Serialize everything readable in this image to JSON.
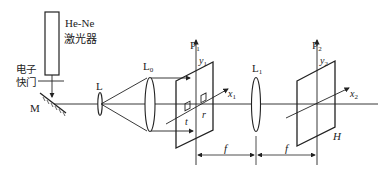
{
  "diagram": {
    "type": "optical-setup",
    "components": {
      "laser": {
        "label_line1": "He-Ne",
        "label_line2": "激光器"
      },
      "shutter": {
        "label_line1": "电子",
        "label_line2": "快门"
      },
      "mirror": {
        "label": "M"
      },
      "lens_expander": {
        "label": "L"
      },
      "lens_collimator": {
        "label": "L",
        "subscript": "0"
      },
      "plane_input": {
        "label": "P",
        "subscript": "1",
        "y_axis": "y",
        "y_sub": "1",
        "x_axis": "x",
        "x_sub": "1"
      },
      "apertures": {
        "t_label": "t",
        "r_label": "r"
      },
      "lens_fourier": {
        "label": "L",
        "subscript": "1"
      },
      "plane_hologram": {
        "label": "P",
        "subscript": "2",
        "y_axis": "y",
        "y_sub": "2",
        "x_axis": "x",
        "x_sub": "2",
        "plate_label": "H"
      }
    },
    "dimensions": [
      {
        "label": "f"
      },
      {
        "label": "f"
      }
    ],
    "colors": {
      "line": "#222222",
      "background": "#ffffff"
    }
  }
}
